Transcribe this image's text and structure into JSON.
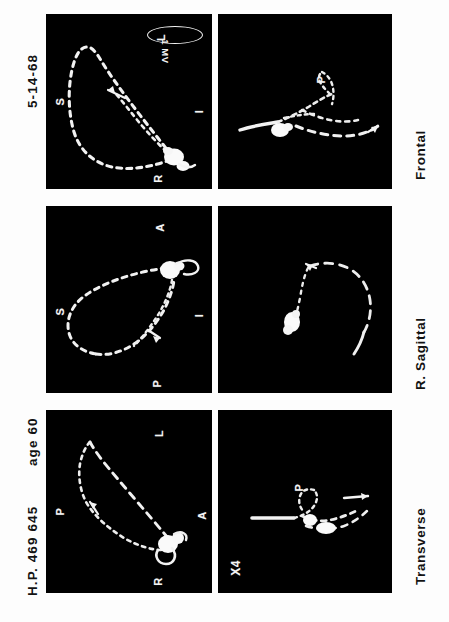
{
  "figure": {
    "orientation": "rotated-90-ccw",
    "background_color": "#fdfdfd",
    "panel_color": "#000000",
    "trace_color": "#f5f5f5"
  },
  "header": {
    "patient_id": "H.P. 469 645",
    "age": "age 60",
    "date": "5-14-68"
  },
  "footer": {
    "views": [
      {
        "label": "Transverse"
      },
      {
        "label": "R. Sagittal"
      },
      {
        "label": "Frontal"
      }
    ]
  },
  "calibration": {
    "text": "1 MV",
    "shape": "ellipse"
  },
  "panels": [
    {
      "id": "transverse-main",
      "view": "Transverse",
      "row": "main",
      "axis_labels": [
        {
          "text": "L",
          "pos": "top"
        },
        {
          "text": "P",
          "pos": "left"
        },
        {
          "text": "A",
          "pos": "right"
        },
        {
          "text": "R",
          "pos": "bottom"
        }
      ],
      "annotations": [],
      "gain": "",
      "has_calibration": false
    },
    {
      "id": "sagittal-main",
      "view": "R. Sagittal",
      "row": "main",
      "axis_labels": [
        {
          "text": "A",
          "pos": "top"
        },
        {
          "text": "S",
          "pos": "left"
        },
        {
          "text": "I",
          "pos": "right"
        },
        {
          "text": "P",
          "pos": "bottom"
        }
      ],
      "annotations": [],
      "gain": "",
      "has_calibration": false
    },
    {
      "id": "frontal-main",
      "view": "Frontal",
      "row": "main",
      "axis_labels": [
        {
          "text": "L",
          "pos": "top"
        },
        {
          "text": "S",
          "pos": "left"
        },
        {
          "text": "I",
          "pos": "right"
        },
        {
          "text": "R",
          "pos": "bottom"
        }
      ],
      "annotations": [],
      "gain": "",
      "has_calibration": true
    },
    {
      "id": "transverse-magnified",
      "view": "Transverse",
      "row": "magnified",
      "axis_labels": [],
      "annotations": [
        {
          "text": "P"
        }
      ],
      "gain": "X4",
      "has_calibration": false
    },
    {
      "id": "sagittal-magnified",
      "view": "R. Sagittal",
      "row": "magnified",
      "axis_labels": [],
      "annotations": [],
      "gain": "",
      "has_calibration": false
    },
    {
      "id": "frontal-magnified",
      "view": "Frontal",
      "row": "magnified",
      "axis_labels": [],
      "annotations": [
        {
          "text": "P"
        }
      ],
      "gain": "",
      "has_calibration": false
    }
  ]
}
